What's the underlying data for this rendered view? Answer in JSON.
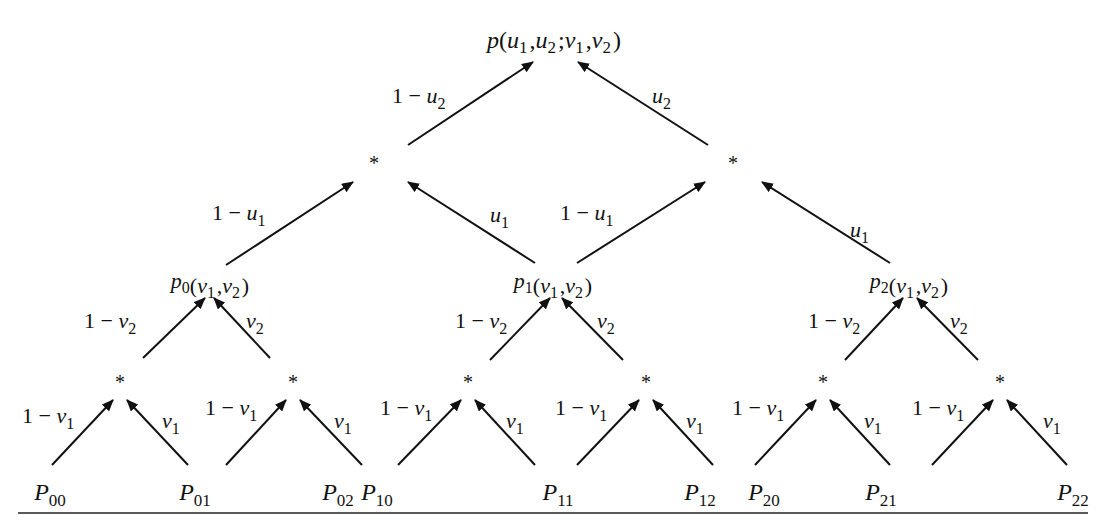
{
  "figure": {
    "root": {
      "name": "p",
      "args": "(u1,u2;v1,v2)",
      "x": 554,
      "y": 48
    },
    "upper_stars": [
      {
        "x": 374,
        "y": 170
      },
      {
        "x": 733,
        "y": 170
      }
    ],
    "mid_nodes": [
      {
        "name": "p",
        "sub": "0",
        "args": "(v1,v2)",
        "x": 210,
        "y": 288
      },
      {
        "name": "p",
        "sub": "1",
        "args": "(v1,v2)",
        "x": 553,
        "y": 288
      },
      {
        "name": "p",
        "sub": "2",
        "args": "(v1,v2)",
        "x": 909,
        "y": 288
      }
    ],
    "lower_stars": [
      {
        "x": 120,
        "y": 389
      },
      {
        "x": 293,
        "y": 389
      },
      {
        "x": 468,
        "y": 389
      },
      {
        "x": 646,
        "y": 389
      },
      {
        "x": 823,
        "y": 389
      },
      {
        "x": 1000,
        "y": 389
      }
    ],
    "control_points": [
      {
        "name": "P",
        "sub": "00",
        "x": 50,
        "y": 500
      },
      {
        "name": "P",
        "sub": "01",
        "x": 195,
        "y": 500
      },
      {
        "name": "P",
        "sub": "02",
        "x": 338,
        "y": 500
      },
      {
        "name": "P",
        "sub": "10",
        "x": 377,
        "y": 500
      },
      {
        "name": "P",
        "sub": "11",
        "x": 558,
        "y": 500
      },
      {
        "name": "P",
        "sub": "12",
        "x": 700,
        "y": 500
      },
      {
        "name": "P",
        "sub": "20",
        "x": 764,
        "y": 500
      },
      {
        "name": "P",
        "sub": "21",
        "x": 881,
        "y": 500
      },
      {
        "name": "P",
        "sub": "22",
        "x": 1073,
        "y": 500
      }
    ],
    "edges": [
      {
        "x1": 408,
        "y1": 145,
        "x2": 533,
        "y2": 62,
        "label": "1 − u",
        "sub": "2",
        "lx": 392,
        "ly": 103,
        "anchor": "start"
      },
      {
        "x1": 708,
        "y1": 145,
        "x2": 578,
        "y2": 62,
        "label": "u",
        "sub": "2",
        "lx": 652,
        "ly": 103,
        "anchor": "start"
      },
      {
        "x1": 226,
        "y1": 265,
        "x2": 353,
        "y2": 182,
        "label": "1 − u",
        "sub": "1",
        "lx": 212,
        "ly": 220,
        "anchor": "start"
      },
      {
        "x1": 535,
        "y1": 263,
        "x2": 408,
        "y2": 182,
        "label": "u",
        "sub": "1",
        "lx": 490,
        "ly": 222,
        "anchor": "start"
      },
      {
        "x1": 577,
        "y1": 263,
        "x2": 705,
        "y2": 182,
        "label": "1 − u",
        "sub": "1",
        "lx": 560,
        "ly": 220,
        "anchor": "start"
      },
      {
        "x1": 890,
        "y1": 263,
        "x2": 762,
        "y2": 182,
        "label": "u",
        "sub": "1",
        "lx": 850,
        "ly": 237,
        "anchor": "start"
      },
      {
        "x1": 143,
        "y1": 358,
        "x2": 205,
        "y2": 298,
        "label": "1 − v",
        "sub": "2",
        "lx": 84,
        "ly": 328,
        "anchor": "start"
      },
      {
        "x1": 270,
        "y1": 358,
        "x2": 214,
        "y2": 298,
        "label": "v",
        "sub": "2",
        "lx": 246,
        "ly": 328,
        "anchor": "start"
      },
      {
        "x1": 490,
        "y1": 360,
        "x2": 550,
        "y2": 298,
        "label": "1 − v",
        "sub": "2",
        "lx": 455,
        "ly": 328,
        "anchor": "start"
      },
      {
        "x1": 623,
        "y1": 360,
        "x2": 562,
        "y2": 298,
        "label": "v",
        "sub": "2",
        "lx": 597,
        "ly": 328,
        "anchor": "start"
      },
      {
        "x1": 845,
        "y1": 360,
        "x2": 903,
        "y2": 298,
        "label": "1 − v",
        "sub": "2",
        "lx": 808,
        "ly": 328,
        "anchor": "start"
      },
      {
        "x1": 978,
        "y1": 360,
        "x2": 917,
        "y2": 298,
        "label": "v",
        "sub": "2",
        "lx": 950,
        "ly": 328,
        "anchor": "start"
      },
      {
        "x1": 52,
        "y1": 465,
        "x2": 113,
        "y2": 400,
        "label": "1 − v",
        "sub": "1",
        "lx": 22,
        "ly": 423,
        "anchor": "start"
      },
      {
        "x1": 188,
        "y1": 465,
        "x2": 127,
        "y2": 400,
        "label": "v",
        "sub": "1",
        "lx": 162,
        "ly": 428,
        "anchor": "start"
      },
      {
        "x1": 226,
        "y1": 465,
        "x2": 286,
        "y2": 400,
        "label": "1 − v",
        "sub": "1",
        "lx": 205,
        "ly": 415,
        "anchor": "start"
      },
      {
        "x1": 362,
        "y1": 465,
        "x2": 300,
        "y2": 400,
        "label": "v",
        "sub": "1",
        "lx": 334,
        "ly": 428,
        "anchor": "start"
      },
      {
        "x1": 398,
        "y1": 465,
        "x2": 461,
        "y2": 400,
        "label": "1 − v",
        "sub": "1",
        "lx": 380,
        "ly": 415,
        "anchor": "start"
      },
      {
        "x1": 535,
        "y1": 465,
        "x2": 475,
        "y2": 400,
        "label": "v",
        "sub": "1",
        "lx": 506,
        "ly": 428,
        "anchor": "start"
      },
      {
        "x1": 577,
        "y1": 465,
        "x2": 639,
        "y2": 400,
        "label": "1 − v",
        "sub": "1",
        "lx": 555,
        "ly": 415,
        "anchor": "start"
      },
      {
        "x1": 713,
        "y1": 465,
        "x2": 653,
        "y2": 400,
        "label": "v",
        "sub": "1",
        "lx": 686,
        "ly": 428,
        "anchor": "start"
      },
      {
        "x1": 755,
        "y1": 465,
        "x2": 816,
        "y2": 400,
        "label": "1 − v",
        "sub": "1",
        "lx": 732,
        "ly": 415,
        "anchor": "start"
      },
      {
        "x1": 890,
        "y1": 465,
        "x2": 830,
        "y2": 400,
        "label": "v",
        "sub": "1",
        "lx": 864,
        "ly": 428,
        "anchor": "start"
      },
      {
        "x1": 932,
        "y1": 465,
        "x2": 993,
        "y2": 400,
        "label": "1 − v",
        "sub": "1",
        "lx": 912,
        "ly": 415,
        "anchor": "start"
      },
      {
        "x1": 1067,
        "y1": 465,
        "x2": 1007,
        "y2": 400,
        "label": "v",
        "sub": "1",
        "lx": 1043,
        "ly": 428,
        "anchor": "start"
      }
    ],
    "baseline_rule": {
      "x1": 18,
      "y1": 513,
      "x2": 1088,
      "y2": 513
    }
  }
}
